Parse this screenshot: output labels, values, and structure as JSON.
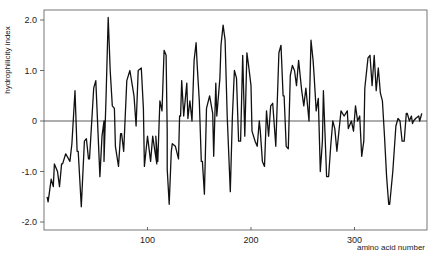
{
  "chart_data": {
    "type": "line",
    "title": "",
    "xlabel": "amino acid number",
    "ylabel": "hydrophilicity index",
    "xlim": [
      0,
      370
    ],
    "ylim": [
      -2.2,
      2.2
    ],
    "grid": false,
    "legend": null,
    "x_ticks": [
      100,
      200,
      300
    ],
    "x_tick_labels": [
      "100",
      "200",
      "300"
    ],
    "y_ticks": [
      2.0,
      1.0,
      0,
      -1.0,
      -2.0
    ],
    "y_tick_labels": [
      "2.0",
      "1.0",
      "0",
      "-1.0",
      "-2.0"
    ],
    "baseline": 0,
    "series": [
      {
        "name": "hydrophilicity",
        "color": "#111111",
        "x": [
          3,
          4,
          7,
          9,
          10,
          13,
          15,
          17,
          18,
          21,
          25,
          27,
          30,
          32,
          33,
          36,
          39,
          41,
          43,
          44,
          48,
          50,
          54,
          56,
          58,
          58,
          60,
          62,
          64,
          66,
          68,
          69,
          72,
          74,
          75,
          77,
          80,
          83,
          87,
          89,
          91,
          94,
          96,
          97,
          100,
          103,
          105,
          109,
          108,
          110,
          112,
          114,
          116,
          118,
          119,
          119,
          121,
          123,
          124,
          127,
          130,
          131,
          132,
          133,
          135,
          138,
          139,
          141,
          143,
          145,
          147,
          148,
          150,
          152,
          153,
          155,
          157,
          160,
          163,
          164,
          166,
          167,
          170,
          171,
          173,
          175,
          177,
          180,
          182,
          184,
          186,
          188,
          190,
          192,
          194,
          196,
          198,
          200,
          201,
          204,
          206,
          208,
          209,
          211,
          213,
          215,
          217,
          219,
          221,
          224,
          227,
          229,
          231,
          232,
          234,
          236,
          238,
          240,
          242,
          244,
          246,
          249,
          251,
          253,
          256,
          258,
          260,
          261,
          263,
          265,
          267,
          269,
          270,
          273,
          275,
          277,
          279,
          281,
          283,
          287,
          290,
          293,
          294,
          297,
          299,
          301,
          303,
          305,
          307,
          309,
          310,
          313,
          315,
          317,
          319,
          321,
          323,
          325,
          327,
          329,
          331,
          333,
          334,
          337,
          340,
          342,
          344,
          346,
          348,
          350,
          351,
          353,
          355,
          356,
          357,
          359,
          362,
          363,
          365
        ],
        "values": [
          -1.5,
          -1.6,
          -1.15,
          -1.3,
          -0.85,
          -1.0,
          -1.3,
          -0.85,
          -0.85,
          -0.65,
          -0.8,
          -0.45,
          0.6,
          -0.6,
          -0.6,
          -1.7,
          -0.4,
          -0.35,
          -0.75,
          -0.75,
          0.65,
          0.8,
          -1.1,
          -0.3,
          0.0,
          -0.8,
          0.5,
          2.05,
          1.0,
          0.3,
          0.25,
          -0.5,
          -0.9,
          -0.25,
          -0.25,
          -0.6,
          0.8,
          1.0,
          0.5,
          -0.1,
          1.0,
          1.05,
          0.25,
          -0.9,
          -0.3,
          -0.8,
          -0.3,
          -0.85,
          -0.3,
          -0.8,
          0.4,
          0.2,
          1.4,
          1.3,
          -0.2,
          -0.95,
          -1.65,
          -0.6,
          -0.45,
          -0.5,
          -0.75,
          0.1,
          0.1,
          0.8,
          0.1,
          0.75,
          0.05,
          0.4,
          0.0,
          1.2,
          1.55,
          1.1,
          0.4,
          -0.8,
          -0.8,
          -1.45,
          0.25,
          0.5,
          0.15,
          -0.7,
          0.75,
          0.1,
          0.85,
          1.5,
          1.9,
          1.6,
          0.1,
          -1.4,
          0.1,
          1.0,
          0.85,
          -0.4,
          -0.4,
          1.3,
          -0.3,
          1.35,
          1.05,
          0.7,
          -0.2,
          -0.4,
          -0.5,
          0.0,
          -0.2,
          -0.8,
          -0.9,
          0.2,
          -0.3,
          0.3,
          0.35,
          -0.5,
          1.35,
          1.5,
          0.5,
          0.5,
          -0.5,
          -0.55,
          0.9,
          1.1,
          1.0,
          0.7,
          1.2,
          0.6,
          0.3,
          0.65,
          0.0,
          1.6,
          1.2,
          0.9,
          0.2,
          0.45,
          -1.0,
          -0.4,
          0.6,
          -1.1,
          -1.1,
          -0.5,
          0.0,
          -0.15,
          -0.6,
          0.2,
          0.1,
          0.2,
          -0.15,
          0.0,
          -0.2,
          0.3,
          0.0,
          0.1,
          -0.7,
          -0.4,
          0.65,
          1.25,
          1.3,
          0.7,
          1.3,
          0.6,
          1.05,
          0.55,
          0.4,
          -0.3,
          -1.1,
          -1.65,
          -1.65,
          -1.0,
          -0.1,
          0.05,
          0.0,
          -0.4,
          -0.4,
          0.15,
          0.15,
          0.0,
          0.1,
          -0.05,
          0.0,
          0.05,
          0.1,
          0.0,
          0.15
        ]
      }
    ]
  }
}
